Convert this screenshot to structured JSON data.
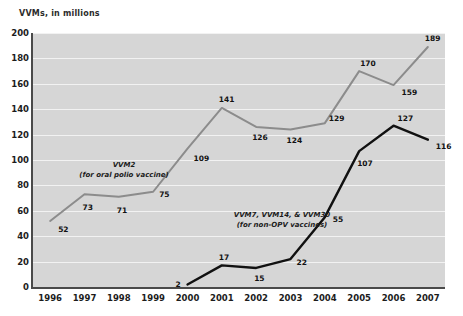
{
  "chart_data": {
    "type": "line",
    "title": "VVMs, in millions",
    "xlabel": "",
    "ylabel": "VVMs, in millions",
    "ylim": [
      0,
      200
    ],
    "ytick_step": 20,
    "yticks": [
      200,
      180,
      160,
      140,
      120,
      100,
      80,
      60,
      40,
      20,
      0
    ],
    "categories": [
      "1996",
      "1997",
      "1998",
      "1999",
      "2000",
      "2001",
      "2002",
      "2003",
      "2004",
      "2005",
      "2006",
      "2007"
    ],
    "grid": "horizontal",
    "legend_position": "inline-annotation",
    "series": [
      {
        "name": "VVM2",
        "annotation_line1": "VVM2",
        "annotation_line2": "(for oral polio vaccine)",
        "color": "#8c8c8c",
        "values": [
          52,
          73,
          71,
          75,
          109,
          141,
          126,
          124,
          129,
          170,
          159,
          189
        ],
        "point_labels": [
          "52",
          "73",
          "71",
          "75",
          "109",
          "141",
          "126",
          "124",
          "129",
          "170",
          "159",
          "189"
        ]
      },
      {
        "name": "VVM7, VVM14, & VVM30",
        "annotation_line1": "VVM7, VVM14, & VVM30",
        "annotation_line2": "(for non-OPV vaccines)",
        "color": "#111111",
        "values": [
          null,
          null,
          null,
          null,
          2,
          17,
          15,
          22,
          55,
          107,
          127,
          116
        ],
        "point_labels": [
          "",
          "",
          "",
          "",
          "2",
          "17",
          "15",
          "22",
          "55",
          "107",
          "127",
          "116"
        ]
      }
    ],
    "plot_background": "#d6d6d6",
    "gridline_color": "#f2f2f2",
    "axis_color": "#4a4a4a"
  }
}
